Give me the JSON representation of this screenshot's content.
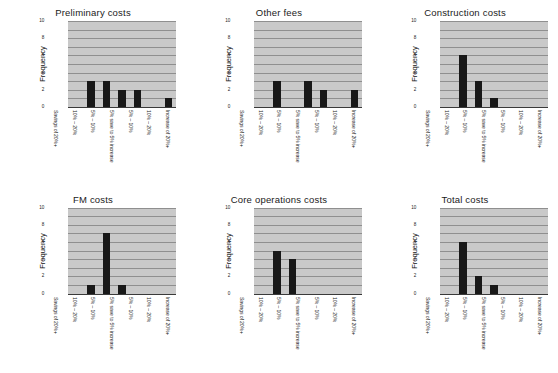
{
  "figure": {
    "axis": {
      "ylabel": "Frequency",
      "yticks": [
        0,
        2,
        4,
        6,
        8,
        10
      ],
      "ylim": [
        0,
        10
      ],
      "gridlines": [
        1,
        2,
        3,
        4,
        5,
        6,
        7,
        8,
        9,
        10
      ]
    },
    "categories": [
      "Savings of 20%+",
      "10% – 20%",
      "5% – 10%",
      "5% save to 5% increase",
      "5% – 10%",
      "10% – 20%",
      "Increase of 20%+"
    ],
    "colors": {
      "bar": "#181818",
      "plot_background": "#c9c9c9",
      "gridline": "#8f8f8f",
      "axis": "#3a3a3a",
      "page_background": "#ffffff"
    }
  },
  "chart_data": [
    {
      "type": "bar",
      "title": "Preliminary costs",
      "xlabel": "",
      "ylabel": "Frequency",
      "ylim": [
        0,
        10
      ],
      "grid": true,
      "legend": "none",
      "categories": [
        "Savings of 20%+",
        "10% – 20%",
        "5% – 10%",
        "5% save to 5% increase",
        "5% – 10%",
        "10% – 20%",
        "Increase of 20%+"
      ],
      "values": [
        0,
        3,
        3,
        2,
        2,
        0,
        1
      ]
    },
    {
      "type": "bar",
      "title": "Other fees",
      "xlabel": "",
      "ylabel": "Frequency",
      "ylim": [
        0,
        10
      ],
      "grid": true,
      "legend": "none",
      "categories": [
        "Savings of 20%+",
        "10% – 20%",
        "5% – 10%",
        "5% save to 5% increase",
        "5% – 10%",
        "10% – 20%",
        "Increase of 20%+"
      ],
      "values": [
        0,
        3,
        0,
        3,
        2,
        0,
        2
      ]
    },
    {
      "type": "bar",
      "title": "Construction costs",
      "xlabel": "",
      "ylabel": "Frequency",
      "ylim": [
        0,
        10
      ],
      "grid": true,
      "legend": "none",
      "categories": [
        "Savings of 20%+",
        "10% – 20%",
        "5% – 10%",
        "5% save to 5% increase",
        "5% – 10%",
        "10% – 20%",
        "Increase of 20%+"
      ],
      "values": [
        0,
        6,
        3,
        1,
        0,
        0,
        0
      ]
    },
    {
      "type": "bar",
      "title": "FM costs",
      "xlabel": "",
      "ylabel": "Frequency",
      "ylim": [
        0,
        10
      ],
      "grid": true,
      "legend": "none",
      "categories": [
        "Savings of 20%+",
        "10% – 20%",
        "5% – 10%",
        "5% save to 5% increase",
        "5% – 10%",
        "10% – 20%",
        "Increase of 20%+"
      ],
      "values": [
        0,
        1,
        7,
        1,
        0,
        0,
        0
      ]
    },
    {
      "type": "bar",
      "title": "Core operations costs",
      "xlabel": "",
      "ylabel": "Frequency",
      "ylim": [
        0,
        10
      ],
      "grid": true,
      "legend": "none",
      "categories": [
        "Savings of 20%+",
        "10% – 20%",
        "5% – 10%",
        "5% save to 5% increase",
        "5% – 10%",
        "10% – 20%",
        "Increase of 20%+"
      ],
      "values": [
        0,
        5,
        4,
        0,
        0,
        0,
        0
      ]
    },
    {
      "type": "bar",
      "title": "Total costs",
      "xlabel": "",
      "ylabel": "Frequency",
      "ylim": [
        0,
        10
      ],
      "grid": true,
      "legend": "none",
      "categories": [
        "Savings of 20%+",
        "10% – 20%",
        "5% – 10%",
        "5% save to 5% increase",
        "5% – 10%",
        "10% – 20%",
        "Increase of 20%+"
      ],
      "values": [
        0,
        6,
        2,
        1,
        0,
        0,
        0
      ]
    }
  ]
}
